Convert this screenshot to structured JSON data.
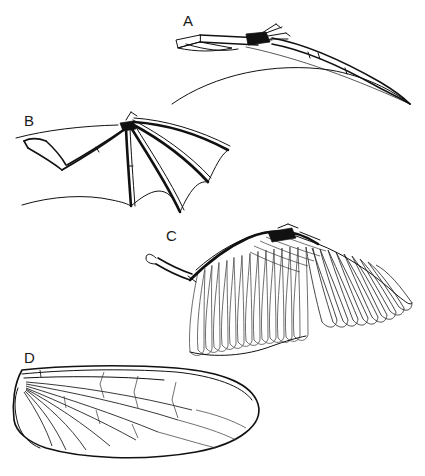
{
  "figure": {
    "background_color": "#ffffff",
    "ink_color": "#111111",
    "width": 425,
    "height": 476,
    "style": "black and white line drawing"
  },
  "panels": [
    {
      "id": "a",
      "label": "A",
      "subject": "pterosaur wing",
      "description": "Elongated fourth finger supporting a narrow membrane spanning from body to wingtip",
      "label_position": {
        "x": 183,
        "y": 26
      }
    },
    {
      "id": "b",
      "label": "B",
      "subject": "bat wing",
      "description": "Four elongated finger bones radiating from the wrist supporting a scalloped skin membrane",
      "label_position": {
        "x": 24,
        "y": 126
      }
    },
    {
      "id": "c",
      "label": "C",
      "subject": "bird wing",
      "description": "Forelimb skeleton with overlapping primary and secondary flight feathers",
      "label_position": {
        "x": 166,
        "y": 241
      }
    },
    {
      "id": "d",
      "label": "D",
      "subject": "insect wing",
      "description": "Membranous wing supported by a branching network of veins forming closed cells",
      "label_position": {
        "x": 24,
        "y": 363
      }
    }
  ]
}
